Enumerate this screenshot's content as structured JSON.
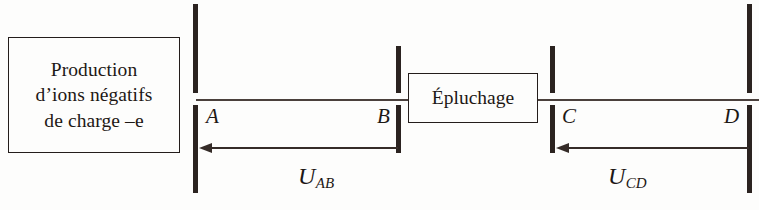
{
  "diagram": {
    "background_color": "#fdfdfc",
    "ink_color": "#241d1b",
    "plate_color": "#2b2320"
  },
  "source_box": {
    "lines": [
      "Production",
      "d’ions négatifs",
      "de charge –e"
    ]
  },
  "stripper_box": {
    "label": "Épluchage"
  },
  "plates": [
    {
      "id": "A",
      "label": "A",
      "height_class": "tall"
    },
    {
      "id": "B",
      "label": "B",
      "height_class": "short"
    },
    {
      "id": "C",
      "label": "C",
      "height_class": "short"
    },
    {
      "id": "D",
      "label": "D",
      "height_class": "tall"
    }
  ],
  "voltages": [
    {
      "id": "U_AB",
      "base": "U",
      "subscript": "AB",
      "direction": "left",
      "from_plate": "B",
      "to_plate": "A"
    },
    {
      "id": "U_CD",
      "base": "U",
      "subscript": "CD",
      "direction": "left",
      "from_plate": "D",
      "to_plate": "C"
    }
  ]
}
